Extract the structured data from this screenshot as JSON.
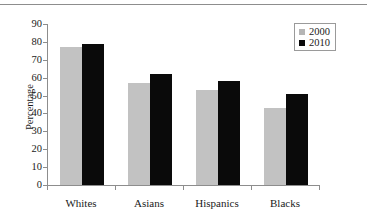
{
  "chart_data": {
    "type": "bar",
    "title": "",
    "xlabel": "",
    "ylabel": "Percentage",
    "categories": [
      "Whites",
      "Asians",
      "Hispanics",
      "Blacks"
    ],
    "series": [
      {
        "name": "2000",
        "color": "#c2c2c2",
        "values": [
          77,
          57,
          53,
          43
        ]
      },
      {
        "name": "2010",
        "color": "#0a0a0a",
        "values": [
          79,
          62,
          58,
          51
        ]
      }
    ],
    "ylim": [
      0,
      90
    ],
    "ytick_values": [
      0,
      10,
      20,
      30,
      40,
      50,
      60,
      70,
      80,
      90
    ],
    "ytick_labels": [
      "0",
      "10",
      "20",
      "30",
      "40",
      "50",
      "60",
      "70",
      "80",
      "90"
    ],
    "grid": false,
    "legend_position": "top-right"
  },
  "legend": {
    "entries": [
      {
        "label": "2000",
        "swatch": "gray-square-marker"
      },
      {
        "label": "2010",
        "swatch": "black-square-marker"
      }
    ]
  },
  "axes": {
    "y_title": "Percentage"
  }
}
